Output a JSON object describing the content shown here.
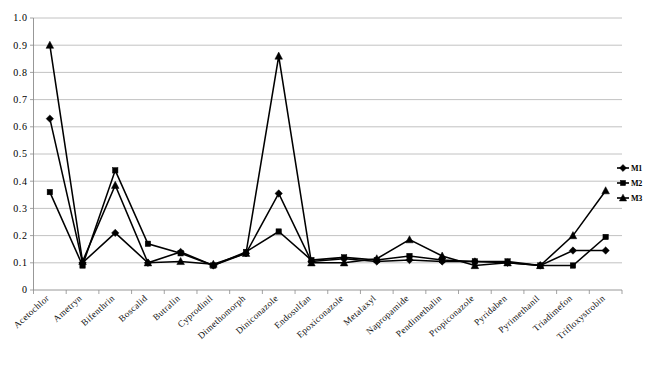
{
  "chart_data": {
    "type": "line",
    "title": "",
    "xlabel": "",
    "ylabel": "",
    "ylim": [
      0,
      1.0
    ],
    "ytick_step": 0.1,
    "grid": true,
    "legend_position": "right",
    "categories": [
      "Acetochlor",
      "Ametryn",
      "Bifenthrin",
      "Boscalid",
      "Butralin",
      "Cyprodinil",
      "Dimethomorph",
      "Diniconazole",
      "Endosulfan",
      "Epoxiconazole",
      "Metalaxyl",
      "Napropamide",
      "Pendimethalin",
      "Propiconazole",
      "Pyridaben",
      "Pyrimethanil",
      "Triadimefon",
      "Trifloxystrobin"
    ],
    "ytick_labels": [
      "0",
      "0.1",
      "0.2",
      "0.3",
      "0.4",
      "0.5",
      "0.6",
      "0.7",
      "0.8",
      "0.9",
      "1.0"
    ],
    "ytick_values": [
      0,
      0.1,
      0.2,
      0.3,
      0.4,
      0.5,
      0.6,
      0.7,
      0.8,
      0.9,
      1.0
    ],
    "series": [
      {
        "name": "M1",
        "marker": "diamond",
        "values": [
          0.63,
          0.1,
          0.21,
          0.1,
          0.14,
          0.09,
          0.135,
          0.355,
          0.105,
          0.115,
          0.105,
          0.11,
          0.105,
          0.105,
          0.1,
          0.09,
          0.145,
          0.145
        ]
      },
      {
        "name": "M2",
        "marker": "square",
        "values": [
          0.36,
          0.09,
          0.44,
          0.17,
          0.135,
          0.09,
          0.14,
          0.215,
          0.11,
          0.12,
          0.11,
          0.125,
          0.11,
          0.105,
          0.105,
          0.09,
          0.09,
          0.195
        ]
      },
      {
        "name": "M3",
        "marker": "triangle",
        "values": [
          0.9,
          0.105,
          0.385,
          0.1,
          0.105,
          0.095,
          0.135,
          0.86,
          0.1,
          0.1,
          0.115,
          0.185,
          0.125,
          0.09,
          0.1,
          0.09,
          0.2,
          0.365
        ]
      }
    ]
  },
  "legend": {
    "items": [
      {
        "label": "M1",
        "marker": "diamond"
      },
      {
        "label": "M2",
        "marker": "square"
      },
      {
        "label": "M3",
        "marker": "triangle"
      }
    ]
  }
}
